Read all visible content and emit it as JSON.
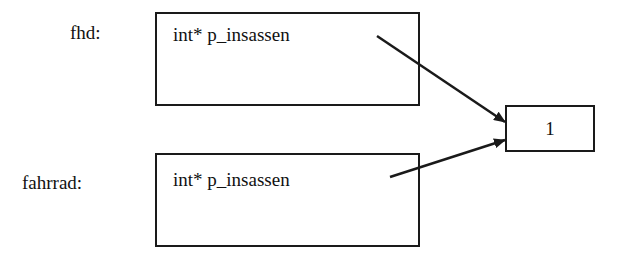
{
  "objects": [
    {
      "label": "fhd:",
      "field": "int* p_insassen"
    },
    {
      "label": "fahrrad:",
      "field": "int* p_insassen"
    }
  ],
  "target": {
    "value": "1"
  },
  "colors": {
    "stroke": "#1a1a1a",
    "background": "#ffffff"
  }
}
